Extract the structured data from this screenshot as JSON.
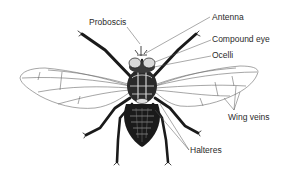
{
  "diagram": {
    "labels": {
      "proboscis": "Proboscis",
      "antenna": "Antenna",
      "compound_eye": "Compound eye",
      "ocelli": "Ocelli",
      "wing_veins": "Wing veins",
      "halteres": "Halteres"
    },
    "colors": {
      "background": "#ffffff",
      "ink": "#1a1a1a",
      "label_text": "#2a2a2a",
      "leader_line": "#555555",
      "wing_line": "#6a6a6a"
    }
  }
}
